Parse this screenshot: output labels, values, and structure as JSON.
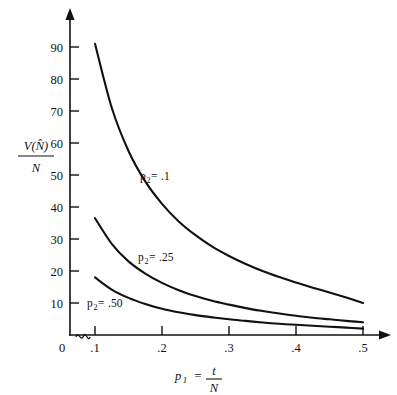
{
  "chart_data": {
    "type": "line",
    "title": "",
    "subtitle": "",
    "xlabel": "p1 = t/N",
    "ylabel": "V(N-hat)/N",
    "xlabel_parts": {
      "symbol": "p",
      "subscript": "1",
      "equals": "=",
      "numerator": "t",
      "denominator": "N"
    },
    "ylabel_parts": {
      "numerator": "V(N̂)",
      "denominator": "N"
    },
    "xlim": [
      0.1,
      0.5
    ],
    "ylim": [
      0,
      95
    ],
    "grid": false,
    "legend_position": "inline-annotations",
    "axis_break_x": true,
    "axis_break_note": "break between 0 and .1 on x-axis",
    "x_ticks": [
      "0",
      ".1",
      ".2",
      ".3",
      ".4",
      ".5"
    ],
    "x_tick_values": [
      0,
      0.1,
      0.2,
      0.3,
      0.4,
      0.5
    ],
    "y_ticks": [
      "10",
      "20",
      "30",
      "40",
      "50",
      "60",
      "70",
      "80",
      "90"
    ],
    "y_tick_values": [
      10,
      20,
      30,
      40,
      50,
      60,
      70,
      80,
      90
    ],
    "x": [
      0.1,
      0.125,
      0.15,
      0.175,
      0.2,
      0.225,
      0.25,
      0.275,
      0.3,
      0.325,
      0.35,
      0.375,
      0.4,
      0.425,
      0.45,
      0.475,
      0.5
    ],
    "series": [
      {
        "name": "p2=.1",
        "label": "p₂=.1",
        "label_parts": {
          "symbol": "p",
          "subscript": "2",
          "equals": "=",
          "value": ".1"
        },
        "values": [
          91.0,
          71.0,
          57.5,
          48.0,
          41.0,
          35.5,
          31.2,
          27.6,
          24.7,
          22.2,
          20.0,
          18.1,
          16.4,
          14.8,
          13.3,
          11.7,
          10.0
        ]
      },
      {
        "name": "p2=.25",
        "label": "p₂=.25",
        "label_parts": {
          "symbol": "p",
          "subscript": "2",
          "equals": "=",
          "value": ".25"
        },
        "values": [
          36.5,
          28.5,
          23.0,
          19.2,
          16.3,
          14.0,
          12.2,
          10.7,
          9.5,
          8.4,
          7.5,
          6.7,
          6.0,
          5.4,
          4.9,
          4.4,
          4.0
        ]
      },
      {
        "name": "p2=.50",
        "label": "p₂=.50",
        "label_parts": {
          "symbol": "p",
          "subscript": "2",
          "equals": "=",
          "value": ".50"
        },
        "values": [
          18.0,
          14.2,
          11.6,
          9.7,
          8.2,
          7.1,
          6.2,
          5.5,
          4.9,
          4.4,
          3.9,
          3.5,
          3.2,
          2.9,
          2.6,
          2.3,
          2.0
        ]
      }
    ]
  }
}
